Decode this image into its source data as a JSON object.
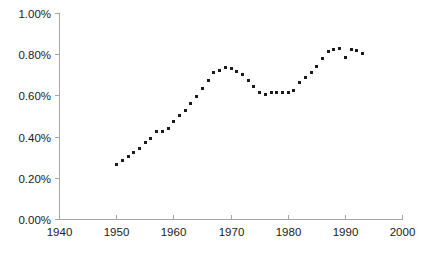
{
  "chart_data": {
    "type": "scatter",
    "title": "",
    "subtitle": "",
    "xlabel": "",
    "ylabel": "",
    "xlim": [
      1940,
      2000
    ],
    "ylim": [
      0.0,
      1.0
    ],
    "grid": false,
    "legend": false,
    "legend_position": "none",
    "marker": "square",
    "marker_color": "#1a1a1a",
    "marker_size_px": 3,
    "x_tick_labels": [
      "1940",
      "1950",
      "1960",
      "1970",
      "1980",
      "1990",
      "2000"
    ],
    "x_ticks": [
      1940,
      1950,
      1960,
      1970,
      1980,
      1990,
      2000
    ],
    "y_tick_labels": [
      "0.00%",
      "0.20%",
      "0.40%",
      "0.60%",
      "0.80%",
      "1.00%"
    ],
    "y_ticks": [
      0.0,
      0.2,
      0.4,
      0.6,
      0.8,
      1.0
    ],
    "y_unit": "%",
    "x": [
      1950,
      1951,
      1952,
      1953,
      1954,
      1955,
      1956,
      1957,
      1958,
      1959,
      1960,
      1961,
      1962,
      1963,
      1964,
      1965,
      1966,
      1967,
      1968,
      1969,
      1970,
      1971,
      1972,
      1973,
      1974,
      1975,
      1976,
      1977,
      1978,
      1979,
      1980,
      1981,
      1982,
      1983,
      1984,
      1985,
      1986,
      1987,
      1988,
      1989,
      1990,
      1991,
      1992,
      1993
    ],
    "values": [
      0.265,
      0.285,
      0.305,
      0.325,
      0.345,
      0.375,
      0.395,
      0.425,
      0.425,
      0.44,
      0.475,
      0.505,
      0.53,
      0.565,
      0.595,
      0.635,
      0.675,
      0.715,
      0.725,
      0.74,
      0.735,
      0.72,
      0.705,
      0.675,
      0.645,
      0.615,
      0.605,
      0.615,
      0.615,
      0.615,
      0.615,
      0.625,
      0.665,
      0.69,
      0.715,
      0.745,
      0.78,
      0.815,
      0.825,
      0.83,
      0.785,
      0.825,
      0.82,
      0.805
    ],
    "series": [
      {
        "name": "series-1",
        "values": [
          0.265,
          0.285,
          0.305,
          0.325,
          0.345,
          0.375,
          0.395,
          0.425,
          0.425,
          0.44,
          0.475,
          0.505,
          0.53,
          0.565,
          0.595,
          0.635,
          0.675,
          0.715,
          0.725,
          0.74,
          0.735,
          0.72,
          0.705,
          0.675,
          0.645,
          0.615,
          0.605,
          0.615,
          0.615,
          0.615,
          0.615,
          0.625,
          0.665,
          0.69,
          0.715,
          0.745,
          0.78,
          0.815,
          0.825,
          0.83,
          0.785,
          0.825,
          0.82,
          0.805
        ]
      }
    ]
  },
  "layout": {
    "plot_left_px": 59,
    "plot_right_px": 402,
    "plot_top_px": 13,
    "plot_bottom_px": 219,
    "axis_color": "#a6a6a6",
    "background_color": "#ffffff",
    "text_color": "#1a1a1a"
  }
}
